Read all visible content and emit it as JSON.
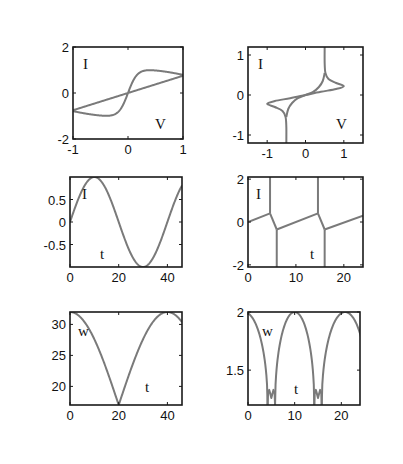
{
  "figure": {
    "background": "#ffffff",
    "curve_color": "#7a7a7a",
    "frame_color": "#1a1a1a"
  },
  "chart_data": [
    {
      "id": "iv-sigmoid",
      "type": "line",
      "position": "top-left",
      "xlabel": "V",
      "ylabel": "I",
      "xlim": [
        -1,
        1
      ],
      "ylim": [
        -2,
        2
      ],
      "xticks": [
        -1,
        0,
        1
      ],
      "xticklabels": [
        "-1",
        "0",
        "1"
      ],
      "yticks": [
        -2,
        0,
        2
      ],
      "yticklabels": [
        "-2",
        "0",
        "2"
      ],
      "series": [
        {
          "name": "loop",
          "kind": "sigmoid-loop",
          "x": [
            -1,
            -0.8,
            -0.6,
            -0.4,
            -0.2,
            -0.1,
            0,
            0.1,
            0.2,
            0.4,
            0.6,
            0.8,
            1,
            0.5,
            0,
            -0.5,
            -1
          ],
          "y": [
            -0.75,
            -0.95,
            -1.05,
            -1.05,
            -0.85,
            -0.5,
            0,
            0.5,
            0.85,
            1.05,
            1.05,
            0.95,
            0.75,
            0.35,
            0,
            -0.35,
            -0.75
          ]
        }
      ]
    },
    {
      "id": "iv-hysteresis",
      "type": "line",
      "position": "top-right",
      "xlabel": "V",
      "ylabel": "I",
      "xlim": [
        -1.5,
        1.5
      ],
      "ylim": [
        -1.2,
        1.2
      ],
      "xticks": [
        -1,
        0,
        1
      ],
      "xticklabels": [
        "-1",
        "0",
        "1"
      ],
      "yticks": [
        -1,
        0,
        1
      ],
      "yticklabels": [
        "-1",
        "0",
        "1"
      ],
      "series": [
        {
          "name": "loop",
          "x": [
            0.5,
            0.5,
            0.52,
            0.6,
            0.8,
            1.0,
            0.8,
            0.4,
            0,
            -0.4,
            -0.8,
            -1.0,
            -0.8,
            -0.6,
            -0.52,
            -0.5,
            -0.5
          ],
          "y": [
            1.2,
            0.8,
            0.55,
            0.4,
            0.3,
            0.22,
            0.15,
            0.08,
            0,
            -0.08,
            -0.15,
            -0.22,
            -0.3,
            -0.4,
            -0.55,
            -0.8,
            -1.2
          ]
        },
        {
          "name": "inner",
          "x": [
            0.5,
            0.45,
            0.35,
            0.2,
            0,
            -0.2,
            -0.35,
            -0.45,
            -0.5
          ],
          "y": [
            0.55,
            0.35,
            0.2,
            0.08,
            0,
            -0.08,
            -0.2,
            -0.35,
            -0.55
          ]
        }
      ]
    },
    {
      "id": "current-sine",
      "type": "line",
      "position": "middle-left",
      "xlabel": "t",
      "ylabel": "I",
      "xlim": [
        0,
        46
      ],
      "ylim": [
        -1,
        1
      ],
      "xticks": [
        0,
        20,
        40
      ],
      "xticklabels": [
        "0",
        "20",
        "40"
      ],
      "yticks": [
        -0.5,
        0,
        0.5
      ],
      "yticklabels": [
        "-0.5",
        "0",
        "0.5"
      ],
      "series": [
        {
          "name": "I(t)",
          "kind": "sine",
          "amplitude": 1.0,
          "period": 40,
          "phase_t0": 0
        }
      ]
    },
    {
      "id": "current-jumps",
      "type": "line",
      "position": "middle-right",
      "xlabel": "t",
      "ylabel": "I",
      "xlim": [
        0,
        24
      ],
      "ylim": [
        -2.1,
        2.1
      ],
      "xticks": [
        0,
        10,
        20
      ],
      "xticklabels": [
        "0",
        "10",
        "20"
      ],
      "yticks": [
        -2,
        0,
        2
      ],
      "yticklabels": [
        "-2",
        "0",
        "2"
      ],
      "series": [
        {
          "name": "I(t)",
          "x": [
            0,
            4.5,
            4.7,
            6,
            6,
            14.5,
            14.7,
            16,
            16,
            24
          ],
          "y": [
            0,
            0.4,
            2.1,
            -0.35,
            -2.1,
            0.4,
            2.1,
            -0.35,
            -2.1,
            0.3
          ]
        }
      ],
      "spikes": [
        {
          "t": 4.6,
          "ymin": 0.4,
          "ymax": 2.1
        },
        {
          "t": 6.0,
          "ymin": -2.1,
          "ymax": -0.35
        },
        {
          "t": 14.6,
          "ymin": 0.4,
          "ymax": 2.1
        },
        {
          "t": 16.0,
          "ymin": -2.1,
          "ymax": -0.35
        }
      ],
      "segments": [
        {
          "x": [
            0,
            4.6
          ],
          "y": [
            0,
            0.4
          ]
        },
        {
          "x": [
            4.6,
            6.0
          ],
          "y": [
            0.4,
            -0.35
          ]
        },
        {
          "x": [
            6.0,
            14.6
          ],
          "y": [
            -0.35,
            0.4
          ]
        },
        {
          "x": [
            14.6,
            16.0
          ],
          "y": [
            0.4,
            -0.35
          ]
        },
        {
          "x": [
            16.0,
            24
          ],
          "y": [
            -0.35,
            0.3
          ]
        }
      ]
    },
    {
      "id": "freq-abs-cos",
      "type": "line",
      "position": "bottom-left",
      "xlabel": "t",
      "ylabel": "w",
      "xlim": [
        0,
        46
      ],
      "ylim": [
        17,
        32
      ],
      "xticks": [
        0,
        20,
        40
      ],
      "xticklabels": [
        "0",
        "20",
        "40"
      ],
      "yticks": [
        20,
        25,
        30
      ],
      "yticklabels": [
        "20",
        "25",
        "30"
      ],
      "series": [
        {
          "name": "w(t)",
          "kind": "abs-cos",
          "max": 32,
          "min": 17,
          "period": 40
        }
      ]
    },
    {
      "id": "freq-arches",
      "type": "line",
      "position": "bottom-right",
      "xlabel": "t",
      "ylabel": "w",
      "xlim": [
        0,
        24
      ],
      "ylim": [
        1.2,
        2
      ],
      "xticks": [
        0,
        10,
        20
      ],
      "xticklabels": [
        "0",
        "10",
        "20"
      ],
      "yticks": [
        1.5,
        2
      ],
      "yticklabels": [
        "1.5",
        "2"
      ],
      "series": [
        {
          "name": "w(t)",
          "kind": "arches",
          "max": 2,
          "period": 10,
          "dips": [
            5,
            15
          ],
          "dip_bump": 1.32
        }
      ]
    }
  ]
}
